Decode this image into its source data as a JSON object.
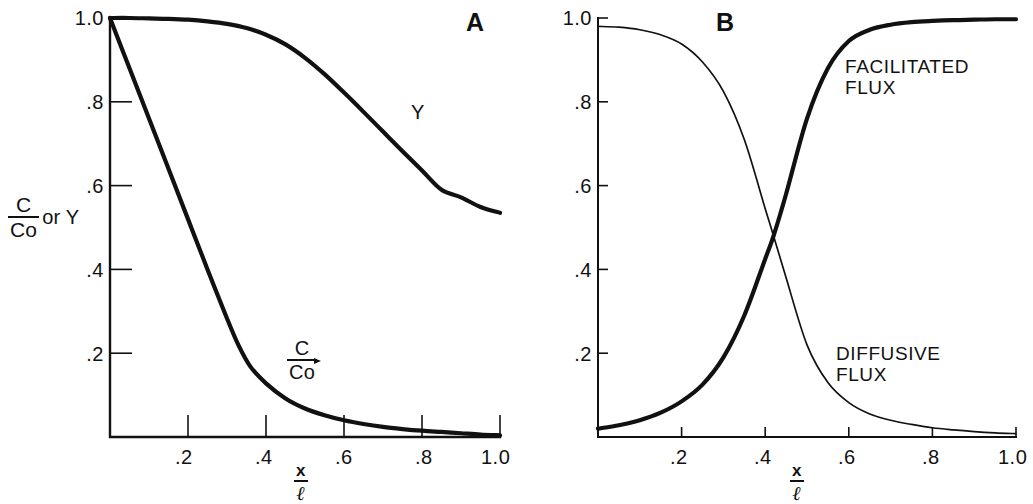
{
  "figure": {
    "background": "#ffffff",
    "ink": "#111111",
    "width": 1033,
    "height": 500
  },
  "panels": [
    {
      "letter": "A",
      "axis": {
        "x_title_num": "x",
        "x_title_den": "ℓ",
        "y_title_num": "C",
        "y_title_den": "Co",
        "y_title_suffix": "or Y",
        "x_ticks": [
          ".2",
          ".4",
          ".6",
          ".8",
          "1.0"
        ],
        "y_ticks": [
          "1.0",
          ".8",
          ".6",
          ".4",
          ".2"
        ],
        "xlim": [
          0,
          1.0
        ],
        "ylim": [
          0,
          1.0
        ]
      },
      "curve_labels": [
        {
          "name": "y-curve-label",
          "text": "Y"
        },
        {
          "name": "c-over-co-label",
          "num": "C",
          "den": "Co"
        }
      ]
    },
    {
      "letter": "B",
      "axis": {
        "x_title_num": "x",
        "x_title_den": "ℓ",
        "x_ticks": [
          ".2",
          ".4",
          ".6",
          ".8",
          "1.0"
        ],
        "y_ticks": [
          "1.0",
          ".8",
          ".6",
          ".4",
          ".2"
        ],
        "xlim": [
          0,
          1.0
        ],
        "ylim": [
          0,
          1.0
        ]
      },
      "series_labels": [
        {
          "name": "facilitated-flux-label",
          "line1": "FACILITATED",
          "line2": "FLUX"
        },
        {
          "name": "diffusive-flux-label",
          "line1": "DIFFUSIVE",
          "line2": "FLUX"
        }
      ]
    }
  ],
  "chart_data": [
    {
      "type": "line",
      "panel": "A",
      "title": "A",
      "xlabel": "x/ℓ",
      "ylabel": "C/Co or Y",
      "xlim": [
        0,
        1.0
      ],
      "ylim": [
        0,
        1.0
      ],
      "xticks": [
        0,
        0.2,
        0.4,
        0.6,
        0.8,
        1.0
      ],
      "xticklabels": [
        "",
        ".2",
        ".4",
        ".6",
        ".8",
        "1.0"
      ],
      "yticks": [
        0,
        0.2,
        0.4,
        0.6,
        0.8,
        1.0
      ],
      "yticklabels": [
        "",
        ".2",
        ".4",
        ".6",
        ".8",
        "1.0"
      ],
      "grid": false,
      "legend": "inline-annotations",
      "series": [
        {
          "name": "Y",
          "label": "Y",
          "linewidth": "thick",
          "x": [
            0.0,
            0.05,
            0.1,
            0.15,
            0.2,
            0.25,
            0.3,
            0.35,
            0.4,
            0.45,
            0.5,
            0.55,
            0.6,
            0.65,
            0.7,
            0.75,
            0.8,
            0.85,
            0.9,
            0.95,
            1.0
          ],
          "y": [
            1.0,
            1.0,
            0.999,
            0.998,
            0.996,
            0.992,
            0.986,
            0.976,
            0.96,
            0.937,
            0.905,
            0.866,
            0.822,
            0.776,
            0.729,
            0.682,
            0.636,
            0.59,
            0.572,
            0.549,
            0.535
          ]
        },
        {
          "name": "C/Co",
          "label": "C/Co",
          "linewidth": "thick",
          "x": [
            0.0,
            0.05,
            0.1,
            0.15,
            0.2,
            0.25,
            0.3,
            0.33,
            0.36,
            0.4,
            0.45,
            0.5,
            0.55,
            0.6,
            0.65,
            0.7,
            0.75,
            0.8,
            0.85,
            0.9,
            0.95,
            1.0
          ],
          "y": [
            1.0,
            0.88,
            0.76,
            0.64,
            0.52,
            0.4,
            0.283,
            0.218,
            0.168,
            0.128,
            0.092,
            0.068,
            0.052,
            0.04,
            0.031,
            0.024,
            0.019,
            0.015,
            0.012,
            0.009,
            0.006,
            0.004
          ]
        }
      ]
    },
    {
      "type": "line",
      "panel": "B",
      "title": "B",
      "xlabel": "x/ℓ",
      "ylabel": "",
      "xlim": [
        0,
        1.0
      ],
      "ylim": [
        0,
        1.0
      ],
      "xticks": [
        0,
        0.2,
        0.4,
        0.6,
        0.8,
        1.0
      ],
      "xticklabels": [
        "",
        ".2",
        ".4",
        ".6",
        ".8",
        "1.0"
      ],
      "yticks": [
        0,
        0.2,
        0.4,
        0.6,
        0.8,
        1.0
      ],
      "yticklabels": [
        "",
        ".2",
        ".4",
        ".6",
        ".8",
        "1.0"
      ],
      "grid": false,
      "legend": "inline-annotations",
      "crossover": {
        "x": 0.42,
        "y": 0.48
      },
      "series": [
        {
          "name": "FACILITATED FLUX",
          "label": "FACILITATED FLUX",
          "linewidth": "thick",
          "x": [
            0.0,
            0.05,
            0.1,
            0.15,
            0.2,
            0.25,
            0.3,
            0.35,
            0.4,
            0.42,
            0.45,
            0.5,
            0.55,
            0.6,
            0.65,
            0.7,
            0.75,
            0.8,
            0.85,
            0.9,
            0.95,
            1.0
          ],
          "y": [
            0.02,
            0.028,
            0.04,
            0.058,
            0.085,
            0.125,
            0.19,
            0.29,
            0.425,
            0.48,
            0.58,
            0.76,
            0.88,
            0.945,
            0.972,
            0.984,
            0.99,
            0.993,
            0.995,
            0.996,
            0.997,
            0.997
          ]
        },
        {
          "name": "DIFFUSIVE FLUX",
          "label": "DIFFUSIVE FLUX",
          "linewidth": "thin",
          "x": [
            0.0,
            0.05,
            0.1,
            0.15,
            0.2,
            0.25,
            0.3,
            0.35,
            0.4,
            0.42,
            0.45,
            0.5,
            0.55,
            0.6,
            0.65,
            0.7,
            0.75,
            0.8,
            0.85,
            0.9,
            0.95,
            1.0
          ],
          "y": [
            0.98,
            0.978,
            0.972,
            0.96,
            0.938,
            0.895,
            0.825,
            0.71,
            0.545,
            0.48,
            0.38,
            0.22,
            0.13,
            0.082,
            0.055,
            0.04,
            0.03,
            0.022,
            0.017,
            0.013,
            0.01,
            0.008
          ]
        }
      ]
    }
  ]
}
